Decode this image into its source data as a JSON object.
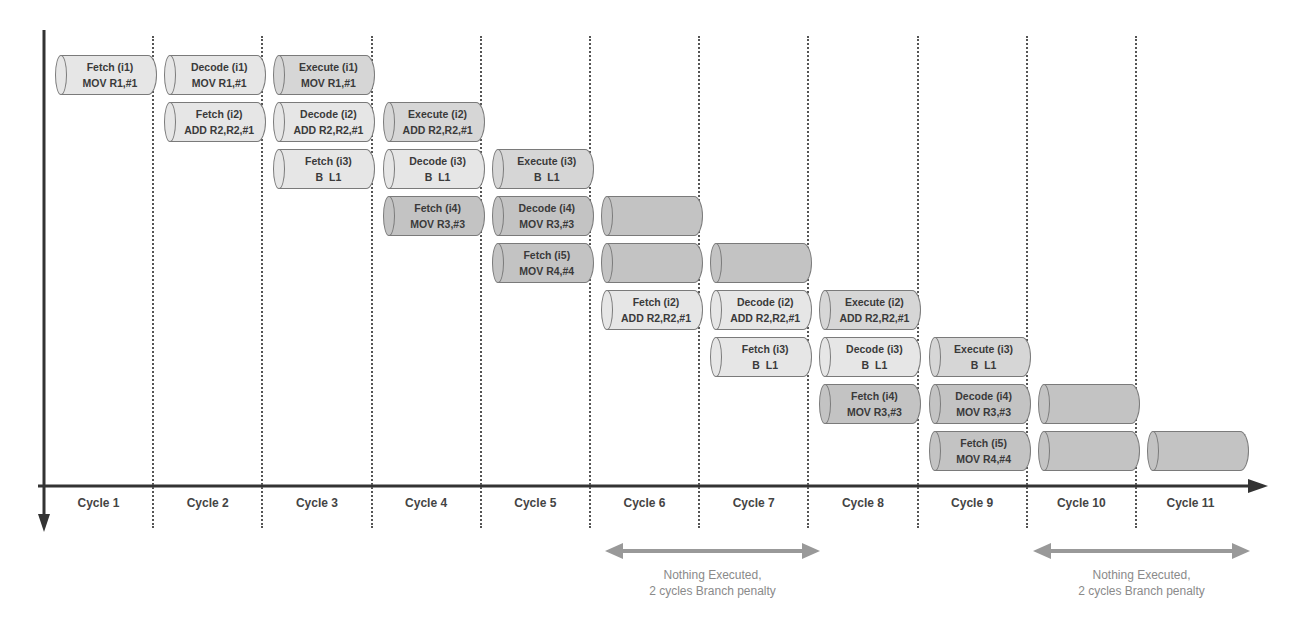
{
  "colors": {
    "fetch_decode": "#e6e6e6",
    "execute": "#d6d6d6",
    "flushed": "#c3c3c3",
    "axis": "#333333",
    "penalty_arrow": "#999999"
  },
  "axis": {
    "x_origin": 44,
    "y_axis_top": 30,
    "y_axis_bottom": 530,
    "x_axis_y": 486,
    "x_axis_end": 1268
  },
  "layout": {
    "col_start": 55,
    "col_pitch": 109.2,
    "row_start": 55,
    "row_pitch": 47,
    "cyl_width": 102
  },
  "cycles": [
    "Cycle 1",
    "Cycle 2",
    "Cycle 3",
    "Cycle 4",
    "Cycle 5",
    "Cycle 6",
    "Cycle 7",
    "Cycle 8",
    "Cycle 9",
    "Cycle 10",
    "Cycle 11"
  ],
  "stages": [
    {
      "col": 0,
      "row": 0,
      "stage": "Fetch (i1)",
      "instr": "MOV R1,#1",
      "kind": "fetch_decode"
    },
    {
      "col": 1,
      "row": 0,
      "stage": "Decode (i1)",
      "instr": "MOV R1,#1",
      "kind": "fetch_decode"
    },
    {
      "col": 2,
      "row": 0,
      "stage": "Execute (i1)",
      "instr": "MOV R1,#1",
      "kind": "execute"
    },
    {
      "col": 1,
      "row": 1,
      "stage": "Fetch (i2)",
      "instr": "ADD R2,R2,#1",
      "kind": "fetch_decode"
    },
    {
      "col": 2,
      "row": 1,
      "stage": "Decode (i2)",
      "instr": "ADD R2,R2,#1",
      "kind": "fetch_decode"
    },
    {
      "col": 3,
      "row": 1,
      "stage": "Execute (i2)",
      "instr": "ADD R2,R2,#1",
      "kind": "execute"
    },
    {
      "col": 2,
      "row": 2,
      "stage": "Fetch (i3)",
      "instr": "B  L1",
      "kind": "fetch_decode"
    },
    {
      "col": 3,
      "row": 2,
      "stage": "Decode (i3)",
      "instr": "B  L1",
      "kind": "fetch_decode"
    },
    {
      "col": 4,
      "row": 2,
      "stage": "Execute (i3)",
      "instr": "B  L1",
      "kind": "execute"
    },
    {
      "col": 3,
      "row": 3,
      "stage": "Fetch (i4)",
      "instr": "MOV R3,#3",
      "kind": "flushed"
    },
    {
      "col": 4,
      "row": 3,
      "stage": "Decode (i4)",
      "instr": "MOV R3,#3",
      "kind": "flushed"
    },
    {
      "col": 5,
      "row": 3,
      "stage": "",
      "instr": "",
      "kind": "flushed"
    },
    {
      "col": 4,
      "row": 4,
      "stage": "Fetch (i5)",
      "instr": "MOV R4,#4",
      "kind": "flushed"
    },
    {
      "col": 5,
      "row": 4,
      "stage": "",
      "instr": "",
      "kind": "flushed"
    },
    {
      "col": 6,
      "row": 4,
      "stage": "",
      "instr": "",
      "kind": "flushed"
    },
    {
      "col": 5,
      "row": 5,
      "stage": "Fetch (i2)",
      "instr": "ADD R2,R2,#1",
      "kind": "fetch_decode"
    },
    {
      "col": 6,
      "row": 5,
      "stage": "Decode (i2)",
      "instr": "ADD R2,R2,#1",
      "kind": "fetch_decode"
    },
    {
      "col": 7,
      "row": 5,
      "stage": "Execute (i2)",
      "instr": "ADD R2,R2,#1",
      "kind": "execute"
    },
    {
      "col": 6,
      "row": 6,
      "stage": "Fetch (i3)",
      "instr": "B  L1",
      "kind": "fetch_decode"
    },
    {
      "col": 7,
      "row": 6,
      "stage": "Decode (i3)",
      "instr": "B  L1",
      "kind": "fetch_decode"
    },
    {
      "col": 8,
      "row": 6,
      "stage": "Execute (i3)",
      "instr": "B  L1",
      "kind": "execute"
    },
    {
      "col": 7,
      "row": 7,
      "stage": "Fetch (i4)",
      "instr": "MOV R3,#3",
      "kind": "flushed"
    },
    {
      "col": 8,
      "row": 7,
      "stage": "Decode (i4)",
      "instr": "MOV R3,#3",
      "kind": "flushed"
    },
    {
      "col": 9,
      "row": 7,
      "stage": "",
      "instr": "",
      "kind": "flushed"
    },
    {
      "col": 8,
      "row": 8,
      "stage": "Fetch (i5)",
      "instr": "MOV R4,#4",
      "kind": "flushed"
    },
    {
      "col": 9,
      "row": 8,
      "stage": "",
      "instr": "",
      "kind": "flushed"
    },
    {
      "col": 10,
      "row": 8,
      "stage": "",
      "instr": "",
      "kind": "flushed"
    }
  ],
  "penalties": [
    {
      "x1": 605,
      "x2": 820,
      "y": 551,
      "line1": "Nothing Executed,",
      "line2": "2 cycles Branch penalty"
    },
    {
      "x1": 1033,
      "x2": 1250,
      "y": 551,
      "line1": "Nothing Executed,",
      "line2": "2 cycles Branch penalty"
    }
  ]
}
